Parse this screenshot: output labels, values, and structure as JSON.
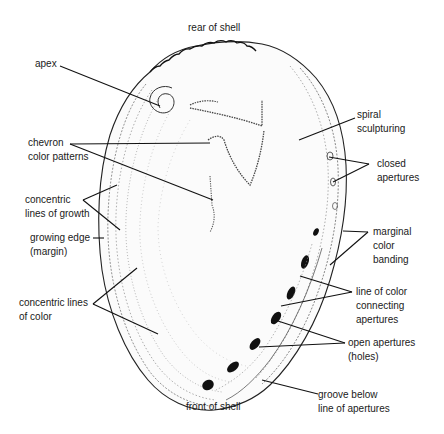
{
  "orientation": {
    "top": "rear of shell",
    "bottom": "front of shell"
  },
  "labels": {
    "apex": [
      "apex"
    ],
    "chevron": [
      "chevron",
      "color patterns"
    ],
    "growth": [
      "concentric",
      "lines of growth"
    ],
    "margin": [
      "growing edge",
      "(margin)"
    ],
    "color_lines": [
      "concentric lines",
      "of color"
    ],
    "spiral": [
      "spiral",
      "sculpturing"
    ],
    "closed": [
      "closed",
      "apertures"
    ],
    "marginal": [
      "marginal",
      "color",
      "banding"
    ],
    "connecting": [
      "line of color",
      "connecting",
      "apertures"
    ],
    "open": [
      "open apertures",
      "(holes)"
    ],
    "groove": [
      "groove below",
      "line of apertures"
    ]
  },
  "colors": {
    "ink": "#1a1a1a",
    "stipple": "#555555",
    "background": "#ffffff"
  }
}
